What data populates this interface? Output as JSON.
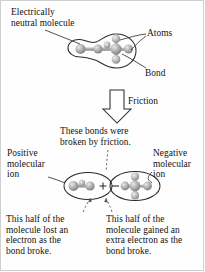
{
  "figure": {
    "background_color": "#fefefe",
    "text_color": "#121212",
    "outline_color": "#2b2b2b",
    "atom_color": "#9a9a9a"
  },
  "labels": {
    "electrically_neutral_molecule": "Electrically\nneutral molecule",
    "atoms": "Atoms",
    "bond": "Bond",
    "friction": "Friction",
    "these_bonds_were_broken": "These bonds were\nbroken by friction.",
    "positive_molecular_ion": "Positive\nmolecular\nion",
    "negative_molecular_ion": "Negative\nmolecular\nion",
    "lost_electron": "This half of the\nmolecule lost an\nelectron as the\nbond broke.",
    "gained_electron": "This half of the\nmolecule gained an\nextra electron as the\nbond broke."
  },
  "charges": {
    "positive_sign": "+",
    "negative_sign": "−"
  },
  "diagram": {
    "top_molecule": {
      "name": "neutral-molecule",
      "atom_count": 7,
      "charge": "neutral"
    },
    "bottom_left_fragment": {
      "name": "positive-molecular-ion",
      "atom_count": 3,
      "charge": "positive"
    },
    "bottom_right_fragment": {
      "name": "negative-molecular-ion",
      "atom_count": 5,
      "charge": "negative"
    },
    "arrow": {
      "name": "friction-arrow",
      "direction": "down"
    }
  }
}
